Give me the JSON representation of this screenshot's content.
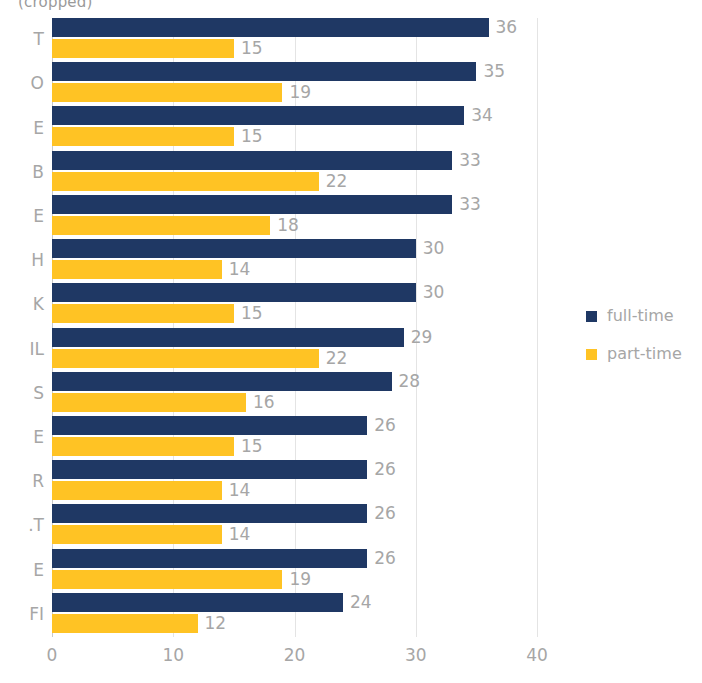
{
  "chart_data": {
    "type": "bar",
    "orientation": "horizontal",
    "title": "(cropped)",
    "xlabel": "",
    "ylabel": "",
    "xlim": [
      0,
      40
    ],
    "xticks": [
      "0",
      "10",
      "20",
      "30",
      "40"
    ],
    "grid": true,
    "legend_position": "right",
    "categories": [
      "T",
      "O",
      "E",
      "B",
      "E",
      "H",
      "K",
      "IL",
      "S",
      "E",
      "R",
      ".T",
      "E",
      "FI"
    ],
    "series": [
      {
        "name": "full-time",
        "color": "#1f3864",
        "values": [
          36,
          35,
          34,
          33,
          33,
          30,
          30,
          29,
          28,
          26,
          26,
          26,
          26,
          24
        ]
      },
      {
        "name": "part-time",
        "color": "#ffc324",
        "values": [
          15,
          19,
          15,
          22,
          18,
          14,
          15,
          22,
          16,
          15,
          14,
          14,
          19,
          12
        ]
      }
    ]
  },
  "legend": {
    "items": [
      {
        "label": "full-time",
        "color": "#1f3864"
      },
      {
        "label": "part-time",
        "color": "#ffc324"
      }
    ]
  },
  "axis": {
    "tick_color": "#a6a6a6",
    "grid_color": "#e4e4e4"
  }
}
